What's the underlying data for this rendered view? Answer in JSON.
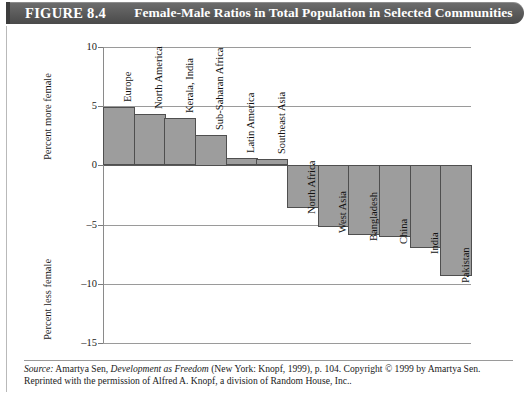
{
  "header": {
    "figure_number": "FIGURE 8.4",
    "title": "Female-Male Ratios in Total Population in Selected Communities"
  },
  "source_note": {
    "label": "Source:",
    "author": "Amartya Sen,",
    "work": "Development as Freedom",
    "rest_line1": "(New York: Knopf, 1999), p. 104. Copyright © 1999 by Amartya Sen.",
    "line2": "Reprinted with the permission of Alfred A. Knopf, a division of Random House, Inc.."
  },
  "chart_data": {
    "type": "bar",
    "title": "Female-Male Ratios in Total Population in Selected Communities",
    "xlabel": "",
    "ylabel": "Percent more female / Percent less female",
    "ylim": [
      -15,
      10
    ],
    "yticks": [
      10,
      5,
      0,
      -5,
      -10,
      -15
    ],
    "ytick_labels": [
      "10",
      "5",
      "0",
      "–5",
      "–10",
      "–15"
    ],
    "grid": true,
    "legend": "none",
    "axis_titles": {
      "upper": "Percent more female",
      "lower": "Percent less female"
    },
    "categories": [
      "Europe",
      "North America",
      "Kerala, India",
      "Sub-Saharan Africa",
      "Latin America",
      "Southeast Asia",
      "North Africa",
      "West Asia",
      "Bangladesh",
      "China",
      "India",
      "Pakistan"
    ],
    "values": [
      4.9,
      4.3,
      4.0,
      2.6,
      0.6,
      0.5,
      -3.6,
      -5.2,
      -5.9,
      -6.1,
      -7.0,
      -9.4
    ],
    "bar_fill": "#9d9d9d",
    "bar_stroke": "#4f4f4f"
  }
}
